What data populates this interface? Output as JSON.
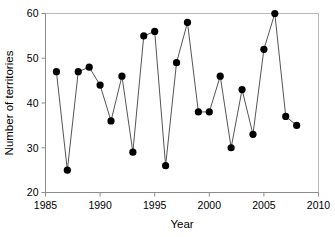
{
  "chart_data": {
    "type": "line",
    "title": "",
    "xlabel": "Year",
    "ylabel": "Number of territories",
    "xlim": [
      1985,
      2010
    ],
    "ylim": [
      20,
      60
    ],
    "xticks": [
      1985,
      1990,
      1995,
      2000,
      2005,
      2010
    ],
    "yticks": [
      20,
      30,
      40,
      50,
      60
    ],
    "xtick_labels": [
      "1985",
      "1990",
      "1995",
      "2000",
      "2005",
      "2010"
    ],
    "ytick_labels": [
      "20",
      "30",
      "40",
      "50",
      "60"
    ],
    "grid": false,
    "legend": null,
    "marker": "filled-circle",
    "x": [
      1986,
      1987,
      1988,
      1989,
      1990,
      1991,
      1992,
      1993,
      1994,
      1995,
      1996,
      1997,
      1998,
      1999,
      2000,
      2001,
      2002,
      2003,
      2004,
      2005,
      2006,
      2007,
      2008
    ],
    "values": [
      47,
      25,
      47,
      48,
      44,
      36,
      46,
      29,
      55,
      56,
      26,
      49,
      58,
      38,
      38,
      46,
      30,
      43,
      33,
      52,
      60,
      37,
      35
    ],
    "series": [
      {
        "name": "Number of territories",
        "values": [
          47,
          25,
          47,
          48,
          44,
          36,
          46,
          29,
          55,
          56,
          26,
          49,
          58,
          38,
          38,
          46,
          30,
          43,
          33,
          52,
          60,
          37,
          35
        ]
      }
    ],
    "colors": {
      "marker": "#000000",
      "line": "#555555",
      "axis": "#8c8c8c",
      "frame": "#b9b9b9",
      "background": "#ffffff"
    }
  }
}
